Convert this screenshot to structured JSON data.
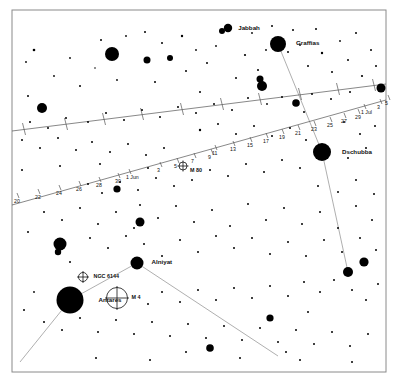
{
  "chart": {
    "type": "scatter",
    "width": 398,
    "height": 383,
    "background_color": "#ffffff",
    "star_color": "#000000",
    "frame_color": "#8a8a8a",
    "line_color": "#555555",
    "constellation_line_color": "#9a9a9a"
  },
  "frame": {
    "x": 12,
    "y": 10,
    "width": 374,
    "height": 362
  },
  "named_stars": [
    {
      "name": "Jabbah",
      "x": 228,
      "y": 28,
      "r": 4.2,
      "label_dx": 6,
      "label_dy": 1.5
    },
    {
      "name": "Graffias",
      "x": 278,
      "y": 44,
      "r": 8.0,
      "label_dx": 10,
      "label_dy": 0.5
    },
    {
      "name": "Dschubba",
      "x": 322,
      "y": 152,
      "r": 9.0,
      "label_dx": 11,
      "label_dy": 1.5
    },
    {
      "name": "Alniyat",
      "x": 137,
      "y": 263,
      "r": 6.5,
      "label_dx": 8,
      "label_dy": 1.0
    },
    {
      "name": "Antares",
      "x": 70,
      "y": 300,
      "r": 13.5,
      "label_dx": 15,
      "label_dy": 1.5
    }
  ],
  "deep_sky_objects": [
    {
      "name": "NGC 6144",
      "x": 83,
      "y": 277,
      "r": 4.5,
      "label_dx": 6,
      "label_dy": 1.2
    },
    {
      "name": "M 4",
      "x": 117,
      "y": 298,
      "r": 10.5,
      "label_dx": 4,
      "label_dy": 1.2
    }
  ],
  "deep_sky_overlay": [
    {
      "name": "M 80",
      "x": 183,
      "y": 166,
      "r": 4.0,
      "label_dx": 3,
      "label_dy": 5.5
    }
  ],
  "path_labels_lower": [
    {
      "text": "20",
      "x": 14,
      "y": 203
    },
    {
      "text": "22",
      "x": 35,
      "y": 199
    },
    {
      "text": "24",
      "x": 56,
      "y": 195
    },
    {
      "text": "26",
      "x": 76,
      "y": 191
    },
    {
      "text": "28",
      "x": 96,
      "y": 187
    },
    {
      "text": "30",
      "x": 115,
      "y": 183
    },
    {
      "text": "1 Jun",
      "x": 126,
      "y": 179
    },
    {
      "text": "3",
      "x": 157,
      "y": 172
    },
    {
      "text": "5",
      "x": 174,
      "y": 168
    },
    {
      "text": "7",
      "x": 191,
      "y": 163
    },
    {
      "text": "9",
      "x": 208,
      "y": 159
    },
    {
      "text": "11",
      "x": 212,
      "y": 155
    },
    {
      "text": "13",
      "x": 230,
      "y": 151
    },
    {
      "text": "15",
      "x": 247,
      "y": 147
    },
    {
      "text": "17",
      "x": 263,
      "y": 143
    },
    {
      "text": "19",
      "x": 279,
      "y": 139
    },
    {
      "text": "21",
      "x": 295,
      "y": 135
    },
    {
      "text": "23",
      "x": 311,
      "y": 131
    },
    {
      "text": "25",
      "x": 327,
      "y": 127
    },
    {
      "text": "27",
      "x": 341,
      "y": 123
    },
    {
      "text": "29",
      "x": 355,
      "y": 119
    },
    {
      "text": "1 Jul",
      "x": 361,
      "y": 114
    },
    {
      "text": "3",
      "x": 377,
      "y": 109
    },
    {
      "text": "5",
      "x": 385,
      "y": 105
    }
  ],
  "stars": [
    {
      "x": 34,
      "y": 50,
      "r": 1.3
    },
    {
      "x": 101,
      "y": 40,
      "r": 1.0
    },
    {
      "x": 28,
      "y": 96,
      "r": 1.0
    },
    {
      "x": 42,
      "y": 108,
      "r": 5.0
    },
    {
      "x": 70,
      "y": 58,
      "r": 0.9
    },
    {
      "x": 80,
      "y": 86,
      "r": 1.0
    },
    {
      "x": 95,
      "y": 68,
      "r": 0.8
    },
    {
      "x": 112,
      "y": 54,
      "r": 7.0
    },
    {
      "x": 117,
      "y": 80,
      "r": 0.9
    },
    {
      "x": 126,
      "y": 36,
      "r": 0.9
    },
    {
      "x": 145,
      "y": 32,
      "r": 1.0
    },
    {
      "x": 147,
      "y": 60,
      "r": 3.5
    },
    {
      "x": 155,
      "y": 82,
      "r": 1.0
    },
    {
      "x": 162,
      "y": 43,
      "r": 1.0
    },
    {
      "x": 170,
      "y": 58,
      "r": 3.0
    },
    {
      "x": 182,
      "y": 36,
      "r": 1.2
    },
    {
      "x": 186,
      "y": 71,
      "r": 1.0
    },
    {
      "x": 196,
      "y": 50,
      "r": 0.9
    },
    {
      "x": 200,
      "y": 92,
      "r": 1.0
    },
    {
      "x": 207,
      "y": 63,
      "r": 1.0
    },
    {
      "x": 216,
      "y": 46,
      "r": 0.9
    },
    {
      "x": 222,
      "y": 31,
      "r": 3.0
    },
    {
      "x": 236,
      "y": 78,
      "r": 1.0
    },
    {
      "x": 245,
      "y": 55,
      "r": 1.1
    },
    {
      "x": 252,
      "y": 33,
      "r": 0.9
    },
    {
      "x": 258,
      "y": 70,
      "r": 1.0
    },
    {
      "x": 262,
      "y": 86,
      "r": 5.0
    },
    {
      "x": 260,
      "y": 79,
      "r": 3.5
    },
    {
      "x": 266,
      "y": 50,
      "r": 0.9
    },
    {
      "x": 272,
      "y": 26,
      "r": 1.0
    },
    {
      "x": 288,
      "y": 52,
      "r": 1.0
    },
    {
      "x": 293,
      "y": 30,
      "r": 1.0
    },
    {
      "x": 300,
      "y": 45,
      "r": 0.9
    },
    {
      "x": 308,
      "y": 66,
      "r": 1.0
    },
    {
      "x": 316,
      "y": 29,
      "r": 1.0
    },
    {
      "x": 322,
      "y": 53,
      "r": 1.2
    },
    {
      "x": 332,
      "y": 72,
      "r": 1.0
    },
    {
      "x": 340,
      "y": 41,
      "r": 0.9
    },
    {
      "x": 348,
      "y": 60,
      "r": 1.0
    },
    {
      "x": 356,
      "y": 33,
      "r": 1.0
    },
    {
      "x": 362,
      "y": 76,
      "r": 1.1
    },
    {
      "x": 371,
      "y": 50,
      "r": 1.0
    },
    {
      "x": 376,
      "y": 66,
      "r": 1.0
    },
    {
      "x": 381,
      "y": 88,
      "r": 4.5
    },
    {
      "x": 350,
      "y": 92,
      "r": 1.0
    },
    {
      "x": 331,
      "y": 99,
      "r": 1.0
    },
    {
      "x": 312,
      "y": 94,
      "r": 1.0
    },
    {
      "x": 296,
      "y": 103,
      "r": 3.8
    },
    {
      "x": 304,
      "y": 112,
      "r": 1.0
    },
    {
      "x": 282,
      "y": 97,
      "r": 1.0
    },
    {
      "x": 267,
      "y": 104,
      "r": 0.9
    },
    {
      "x": 248,
      "y": 98,
      "r": 1.0
    },
    {
      "x": 232,
      "y": 110,
      "r": 1.0
    },
    {
      "x": 214,
      "y": 104,
      "r": 1.0
    },
    {
      "x": 196,
      "y": 113,
      "r": 1.0
    },
    {
      "x": 178,
      "y": 107,
      "r": 1.0
    },
    {
      "x": 160,
      "y": 117,
      "r": 1.0
    },
    {
      "x": 142,
      "y": 110,
      "r": 1.0
    },
    {
      "x": 124,
      "y": 120,
      "r": 1.0
    },
    {
      "x": 106,
      "y": 113,
      "r": 1.0
    },
    {
      "x": 88,
      "y": 122,
      "r": 1.0
    },
    {
      "x": 66,
      "y": 118,
      "r": 1.0
    },
    {
      "x": 48,
      "y": 128,
      "r": 1.0
    },
    {
      "x": 30,
      "y": 122,
      "r": 1.0
    },
    {
      "x": 22,
      "y": 140,
      "r": 1.0
    },
    {
      "x": 40,
      "y": 148,
      "r": 1.0
    },
    {
      "x": 58,
      "y": 138,
      "r": 1.0
    },
    {
      "x": 76,
      "y": 150,
      "r": 1.0
    },
    {
      "x": 92,
      "y": 142,
      "r": 1.0
    },
    {
      "x": 110,
      "y": 152,
      "r": 1.0
    },
    {
      "x": 128,
      "y": 144,
      "r": 1.0
    },
    {
      "x": 146,
      "y": 155,
      "r": 1.0
    },
    {
      "x": 164,
      "y": 148,
      "r": 1.0
    },
    {
      "x": 200,
      "y": 130,
      "r": 1.2
    },
    {
      "x": 218,
      "y": 124,
      "r": 1.0
    },
    {
      "x": 236,
      "y": 134,
      "r": 1.0
    },
    {
      "x": 254,
      "y": 126,
      "r": 1.0
    },
    {
      "x": 272,
      "y": 136,
      "r": 1.0
    },
    {
      "x": 290,
      "y": 128,
      "r": 1.0
    },
    {
      "x": 306,
      "y": 140,
      "r": 1.0
    },
    {
      "x": 344,
      "y": 122,
      "r": 1.0
    },
    {
      "x": 360,
      "y": 134,
      "r": 1.0
    },
    {
      "x": 375,
      "y": 126,
      "r": 1.0
    },
    {
      "x": 366,
      "y": 148,
      "r": 1.0
    },
    {
      "x": 348,
      "y": 158,
      "r": 1.0
    },
    {
      "x": 300,
      "y": 168,
      "r": 1.0
    },
    {
      "x": 282,
      "y": 160,
      "r": 1.0
    },
    {
      "x": 264,
      "y": 172,
      "r": 1.0
    },
    {
      "x": 246,
      "y": 164,
      "r": 1.0
    },
    {
      "x": 228,
      "y": 176,
      "r": 1.0
    },
    {
      "x": 210,
      "y": 170,
      "r": 1.0
    },
    {
      "x": 192,
      "y": 180,
      "r": 1.0
    },
    {
      "x": 174,
      "y": 186,
      "r": 1.0
    },
    {
      "x": 156,
      "y": 178,
      "r": 1.0
    },
    {
      "x": 138,
      "y": 190,
      "r": 1.0
    },
    {
      "x": 120,
      "y": 182,
      "r": 1.0
    },
    {
      "x": 102,
      "y": 193,
      "r": 1.0
    },
    {
      "x": 88,
      "y": 184,
      "r": 1.0
    },
    {
      "x": 117,
      "y": 189,
      "r": 3.6
    },
    {
      "x": 44,
      "y": 212,
      "r": 1.0
    },
    {
      "x": 62,
      "y": 220,
      "r": 1.0
    },
    {
      "x": 80,
      "y": 208,
      "r": 1.0
    },
    {
      "x": 98,
      "y": 224,
      "r": 1.0
    },
    {
      "x": 116,
      "y": 212,
      "r": 1.0
    },
    {
      "x": 134,
      "y": 228,
      "r": 1.0
    },
    {
      "x": 140,
      "y": 205,
      "r": 1.0
    },
    {
      "x": 158,
      "y": 218,
      "r": 1.0
    },
    {
      "x": 176,
      "y": 206,
      "r": 1.0
    },
    {
      "x": 194,
      "y": 222,
      "r": 1.0
    },
    {
      "x": 212,
      "y": 210,
      "r": 1.0
    },
    {
      "x": 230,
      "y": 226,
      "r": 1.0
    },
    {
      "x": 248,
      "y": 204,
      "r": 1.0
    },
    {
      "x": 266,
      "y": 220,
      "r": 1.0
    },
    {
      "x": 284,
      "y": 208,
      "r": 1.0
    },
    {
      "x": 302,
      "y": 224,
      "r": 1.0
    },
    {
      "x": 320,
      "y": 212,
      "r": 1.0
    },
    {
      "x": 338,
      "y": 228,
      "r": 1.0
    },
    {
      "x": 356,
      "y": 206,
      "r": 1.0
    },
    {
      "x": 372,
      "y": 220,
      "r": 1.0
    },
    {
      "x": 28,
      "y": 232,
      "r": 1.0
    },
    {
      "x": 60,
      "y": 244,
      "r": 6.5
    },
    {
      "x": 58,
      "y": 252,
      "r": 3.2
    },
    {
      "x": 90,
      "y": 238,
      "r": 1.0
    },
    {
      "x": 108,
      "y": 248,
      "r": 1.0
    },
    {
      "x": 126,
      "y": 236,
      "r": 1.0
    },
    {
      "x": 70,
      "y": 262,
      "r": 1.0
    },
    {
      "x": 144,
      "y": 244,
      "r": 1.0
    },
    {
      "x": 162,
      "y": 256,
      "r": 1.0
    },
    {
      "x": 180,
      "y": 240,
      "r": 1.0
    },
    {
      "x": 198,
      "y": 252,
      "r": 1.0
    },
    {
      "x": 140,
      "y": 222,
      "r": 4.5
    },
    {
      "x": 216,
      "y": 236,
      "r": 1.0
    },
    {
      "x": 234,
      "y": 248,
      "r": 1.0
    },
    {
      "x": 252,
      "y": 238,
      "r": 1.0
    },
    {
      "x": 270,
      "y": 254,
      "r": 1.0
    },
    {
      "x": 288,
      "y": 242,
      "r": 1.0
    },
    {
      "x": 306,
      "y": 256,
      "r": 1.0
    },
    {
      "x": 324,
      "y": 240,
      "r": 1.0
    },
    {
      "x": 342,
      "y": 252,
      "r": 1.0
    },
    {
      "x": 360,
      "y": 238,
      "r": 1.0
    },
    {
      "x": 376,
      "y": 250,
      "r": 1.0
    },
    {
      "x": 364,
      "y": 262,
      "r": 4.6
    },
    {
      "x": 348,
      "y": 272,
      "r": 5.0
    },
    {
      "x": 352,
      "y": 290,
      "r": 1.0
    },
    {
      "x": 334,
      "y": 280,
      "r": 1.0
    },
    {
      "x": 366,
      "y": 300,
      "r": 1.0
    },
    {
      "x": 378,
      "y": 284,
      "r": 1.0
    },
    {
      "x": 320,
      "y": 292,
      "r": 1.0
    },
    {
      "x": 304,
      "y": 282,
      "r": 1.0
    },
    {
      "x": 288,
      "y": 296,
      "r": 1.0
    },
    {
      "x": 270,
      "y": 286,
      "r": 1.0
    },
    {
      "x": 252,
      "y": 298,
      "r": 1.0
    },
    {
      "x": 234,
      "y": 288,
      "r": 1.0
    },
    {
      "x": 216,
      "y": 300,
      "r": 1.0
    },
    {
      "x": 198,
      "y": 290,
      "r": 1.0
    },
    {
      "x": 180,
      "y": 302,
      "r": 1.0
    },
    {
      "x": 162,
      "y": 292,
      "r": 1.0
    },
    {
      "x": 148,
      "y": 304,
      "r": 1.0
    },
    {
      "x": 34,
      "y": 292,
      "r": 0.9
    },
    {
      "x": 24,
      "y": 310,
      "r": 1.0
    },
    {
      "x": 44,
      "y": 322,
      "r": 1.0
    },
    {
      "x": 62,
      "y": 330,
      "r": 1.0
    },
    {
      "x": 80,
      "y": 318,
      "r": 1.0
    },
    {
      "x": 98,
      "y": 332,
      "r": 1.0
    },
    {
      "x": 116,
      "y": 320,
      "r": 1.0
    },
    {
      "x": 134,
      "y": 334,
      "r": 1.0
    },
    {
      "x": 152,
      "y": 322,
      "r": 1.0
    },
    {
      "x": 170,
      "y": 336,
      "r": 1.0
    },
    {
      "x": 188,
      "y": 324,
      "r": 1.0
    },
    {
      "x": 206,
      "y": 338,
      "r": 1.0
    },
    {
      "x": 224,
      "y": 326,
      "r": 1.0
    },
    {
      "x": 242,
      "y": 340,
      "r": 1.0
    },
    {
      "x": 260,
      "y": 328,
      "r": 1.0
    },
    {
      "x": 278,
      "y": 342,
      "r": 1.0
    },
    {
      "x": 296,
      "y": 330,
      "r": 1.0
    },
    {
      "x": 314,
      "y": 344,
      "r": 1.0
    },
    {
      "x": 332,
      "y": 332,
      "r": 1.0
    },
    {
      "x": 350,
      "y": 346,
      "r": 1.0
    },
    {
      "x": 368,
      "y": 334,
      "r": 1.0
    },
    {
      "x": 210,
      "y": 348,
      "r": 3.8
    },
    {
      "x": 270,
      "y": 318,
      "r": 3.6
    },
    {
      "x": 308,
      "y": 312,
      "r": 1.0
    },
    {
      "x": 186,
      "y": 352,
      "r": 1.0
    },
    {
      "x": 96,
      "y": 358,
      "r": 1.0
    },
    {
      "x": 150,
      "y": 360,
      "r": 1.0
    },
    {
      "x": 240,
      "y": 358,
      "r": 1.0
    },
    {
      "x": 300,
      "y": 360,
      "r": 1.0
    },
    {
      "x": 352,
      "y": 362,
      "r": 1.0
    },
    {
      "x": 286,
      "y": 352,
      "r": 1.0
    },
    {
      "x": 22,
      "y": 170,
      "r": 1.0
    },
    {
      "x": 60,
      "y": 166,
      "r": 1.0
    },
    {
      "x": 100,
      "y": 164,
      "r": 1.0
    },
    {
      "x": 148,
      "y": 168,
      "r": 1.0
    },
    {
      "x": 26,
      "y": 62,
      "r": 0.9
    },
    {
      "x": 54,
      "y": 76,
      "r": 0.9
    },
    {
      "x": 338,
      "y": 192,
      "r": 1.0
    },
    {
      "x": 356,
      "y": 180,
      "r": 1.0
    },
    {
      "x": 374,
      "y": 194,
      "r": 1.0
    },
    {
      "x": 318,
      "y": 186,
      "r": 1.0
    }
  ],
  "constellation_lines": [
    {
      "x1": 278,
      "y1": 44,
      "x2": 322,
      "y2": 152
    },
    {
      "x1": 322,
      "y1": 152,
      "x2": 348,
      "y2": 272
    },
    {
      "x1": 137,
      "y1": 263,
      "x2": 70,
      "y2": 300
    },
    {
      "x1": 137,
      "y1": 263,
      "x2": 278,
      "y2": 356
    },
    {
      "x1": 70,
      "y1": 300,
      "x2": 20,
      "y2": 362
    }
  ],
  "path_lines": {
    "ecliptic": {
      "x1": 12,
      "y1": 131,
      "x2": 386,
      "y2": 84
    },
    "planet_track": {
      "x1": 12,
      "y1": 205,
      "x2": 386,
      "y2": 100
    }
  },
  "ecliptic_ticks": [
    {
      "x": 24,
      "y": 129
    },
    {
      "x": 66,
      "y": 124
    },
    {
      "x": 104,
      "y": 119
    },
    {
      "x": 142,
      "y": 114
    },
    {
      "x": 182,
      "y": 109
    },
    {
      "x": 222,
      "y": 104
    },
    {
      "x": 260,
      "y": 99
    },
    {
      "x": 300,
      "y": 94
    },
    {
      "x": 338,
      "y": 89
    },
    {
      "x": 374,
      "y": 85
    }
  ]
}
